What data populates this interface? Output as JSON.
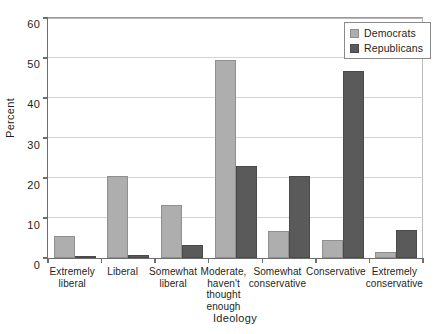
{
  "chart_data": {
    "type": "bar",
    "title": "",
    "xlabel": "Ideology",
    "ylabel": "Percent",
    "ylim": [
      0,
      60
    ],
    "yticks": [
      0,
      10,
      20,
      30,
      40,
      50,
      60
    ],
    "grid": true,
    "legend_position": "top-right",
    "categories": [
      "Extremely liberal",
      "Liberal",
      "Somewhat liberal",
      "Moderate, haven't thought enough",
      "Somewhat conservative",
      "Conservative",
      "Extremely conservative"
    ],
    "category_lines": [
      [
        "Extremely",
        "liberal"
      ],
      [
        "Liberal"
      ],
      [
        "Somewhat",
        "liberal"
      ],
      [
        "Moderate,",
        "haven't",
        "thought",
        "enough"
      ],
      [
        "Somewhat",
        "conservative"
      ],
      [
        "Conservative"
      ],
      [
        "Extremely",
        "conservative"
      ]
    ],
    "series": [
      {
        "name": "Democrats",
        "color": "#aeaeae",
        "values": [
          5.5,
          20.3,
          13.3,
          49.4,
          6.7,
          4.5,
          1.5
        ]
      },
      {
        "name": "Republicans",
        "color": "#5a5a5a",
        "values": [
          0.3,
          0.8,
          3.2,
          23.0,
          20.5,
          46.5,
          7.0
        ]
      }
    ]
  },
  "axis": {
    "y_title": "Percent",
    "x_title": "Ideology",
    "y_tick_labels": [
      "0",
      "10",
      "20",
      "30",
      "40",
      "50",
      "60"
    ]
  },
  "legend": {
    "items": [
      {
        "label": "Democrats"
      },
      {
        "label": "Republicans"
      }
    ]
  }
}
